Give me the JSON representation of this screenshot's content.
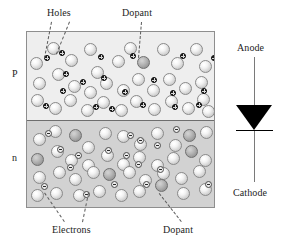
{
  "figure": {
    "title_labels": {
      "holes": "Holes",
      "dopant_top": "Dopant",
      "electrons": "Electrons",
      "dopant_bottom": "Dopant"
    },
    "region_labels": {
      "p": "P",
      "n": "n"
    },
    "diode": {
      "anode": "Anode",
      "cathode": "Cathode"
    },
    "colors": {
      "p_region_fill": "#eeeeee",
      "n_region_fill": "#d2d2d2",
      "block_border": "#8e8e8e",
      "junction_line": "#6e6e6e",
      "atom_light": "#f2f2f2",
      "atom_dopant": "#b6b6b6",
      "hole_fill": "#1c1c1c",
      "electron_fill": "#ececec",
      "diode_fill": "#000000",
      "leader_line": "#5c5c5c",
      "text": "#1d1d1d"
    }
  },
  "diagram_data": {
    "type": "schematic",
    "subject": "pn-junction semiconductor with dopants, holes and electrons, beside diode symbol",
    "block": {
      "x": 26,
      "y": 31,
      "width": 189,
      "height": 177
    },
    "p_region": {
      "x": 0,
      "y": 0,
      "width": 189,
      "height": 89
    },
    "n_region": {
      "x": 0,
      "y": 89,
      "width": 189,
      "height": 88
    },
    "p_atoms": [
      {
        "x": 3,
        "y": 25,
        "kind": "light"
      },
      {
        "x": 20,
        "y": 10,
        "kind": "light"
      },
      {
        "x": 38,
        "y": 22,
        "kind": "light"
      },
      {
        "x": 57,
        "y": 11,
        "kind": "light"
      },
      {
        "x": 64,
        "y": 34,
        "kind": "light"
      },
      {
        "x": 85,
        "y": 23,
        "kind": "light"
      },
      {
        "x": 97,
        "y": 10,
        "kind": "light"
      },
      {
        "x": 110,
        "y": 24,
        "kind": "dark"
      },
      {
        "x": 130,
        "y": 11,
        "kind": "light"
      },
      {
        "x": 144,
        "y": 25,
        "kind": "light"
      },
      {
        "x": 163,
        "y": 11,
        "kind": "light"
      },
      {
        "x": 172,
        "y": 28,
        "kind": "light"
      },
      {
        "x": 6,
        "y": 45,
        "kind": "light"
      },
      {
        "x": 25,
        "y": 36,
        "kind": "light"
      },
      {
        "x": 41,
        "y": 48,
        "kind": "light"
      },
      {
        "x": 57,
        "y": 54,
        "kind": "light"
      },
      {
        "x": 73,
        "y": 45,
        "kind": "light"
      },
      {
        "x": 90,
        "y": 52,
        "kind": "light"
      },
      {
        "x": 105,
        "y": 41,
        "kind": "light"
      },
      {
        "x": 120,
        "y": 52,
        "kind": "light"
      },
      {
        "x": 136,
        "y": 41,
        "kind": "light"
      },
      {
        "x": 152,
        "y": 50,
        "kind": "light"
      },
      {
        "x": 168,
        "y": 44,
        "kind": "light"
      },
      {
        "x": 4,
        "y": 62,
        "kind": "light"
      },
      {
        "x": 22,
        "y": 70,
        "kind": "light"
      },
      {
        "x": 37,
        "y": 62,
        "kind": "light"
      },
      {
        "x": 54,
        "y": 72,
        "kind": "light"
      },
      {
        "x": 70,
        "y": 64,
        "kind": "light"
      },
      {
        "x": 88,
        "y": 72,
        "kind": "light"
      },
      {
        "x": 103,
        "y": 63,
        "kind": "light"
      },
      {
        "x": 121,
        "y": 71,
        "kind": "light"
      },
      {
        "x": 138,
        "y": 63,
        "kind": "light"
      },
      {
        "x": 155,
        "y": 70,
        "kind": "light"
      },
      {
        "x": 170,
        "y": 61,
        "kind": "light"
      },
      {
        "x": 175,
        "y": 73,
        "kind": "light"
      }
    ],
    "p_holes": [
      {
        "x": 17,
        "y": 23
      },
      {
        "x": 32,
        "y": 18
      },
      {
        "x": 71,
        "y": 22
      },
      {
        "x": 103,
        "y": 21
      },
      {
        "x": 153,
        "y": 21
      },
      {
        "x": 184,
        "y": 23
      },
      {
        "x": 36,
        "y": 39
      },
      {
        "x": 53,
        "y": 47
      },
      {
        "x": 74,
        "y": 43
      },
      {
        "x": 124,
        "y": 45
      },
      {
        "x": 33,
        "y": 56
      },
      {
        "x": 95,
        "y": 57
      },
      {
        "x": 143,
        "y": 58
      },
      {
        "x": 174,
        "y": 56
      },
      {
        "x": 16,
        "y": 71
      },
      {
        "x": 66,
        "y": 72
      },
      {
        "x": 82,
        "y": 74
      },
      {
        "x": 113,
        "y": 70
      },
      {
        "x": 145,
        "y": 72
      },
      {
        "x": 169,
        "y": 70
      }
    ],
    "n_atoms": [
      {
        "x": 6,
        "y": 12,
        "kind": "light"
      },
      {
        "x": 22,
        "y": 4,
        "kind": "light"
      },
      {
        "x": 42,
        "y": 8,
        "kind": "dark"
      },
      {
        "x": 55,
        "y": 20,
        "kind": "light"
      },
      {
        "x": 72,
        "y": 6,
        "kind": "light"
      },
      {
        "x": 90,
        "y": 9,
        "kind": "light"
      },
      {
        "x": 107,
        "y": 17,
        "kind": "light"
      },
      {
        "x": 124,
        "y": 6,
        "kind": "light"
      },
      {
        "x": 142,
        "y": 18,
        "kind": "light"
      },
      {
        "x": 156,
        "y": 8,
        "kind": "dark"
      },
      {
        "x": 173,
        "y": 5,
        "kind": "light"
      },
      {
        "x": 4,
        "y": 32,
        "kind": "dark"
      },
      {
        "x": 24,
        "y": 24,
        "kind": "light"
      },
      {
        "x": 38,
        "y": 33,
        "kind": "light"
      },
      {
        "x": 55,
        "y": 38,
        "kind": "light"
      },
      {
        "x": 74,
        "y": 28,
        "kind": "light"
      },
      {
        "x": 90,
        "y": 37,
        "kind": "light"
      },
      {
        "x": 106,
        "y": 30,
        "kind": "light"
      },
      {
        "x": 124,
        "y": 38,
        "kind": "light"
      },
      {
        "x": 140,
        "y": 31,
        "kind": "light"
      },
      {
        "x": 158,
        "y": 24,
        "kind": "dark"
      },
      {
        "x": 172,
        "y": 33,
        "kind": "light"
      },
      {
        "x": 6,
        "y": 50,
        "kind": "light"
      },
      {
        "x": 26,
        "y": 45,
        "kind": "light"
      },
      {
        "x": 42,
        "y": 52,
        "kind": "light"
      },
      {
        "x": 60,
        "y": 45,
        "kind": "light"
      },
      {
        "x": 76,
        "y": 47,
        "kind": "dark"
      },
      {
        "x": 96,
        "y": 45,
        "kind": "light"
      },
      {
        "x": 112,
        "y": 53,
        "kind": "light"
      },
      {
        "x": 130,
        "y": 46,
        "kind": "light"
      },
      {
        "x": 148,
        "y": 51,
        "kind": "light"
      },
      {
        "x": 166,
        "y": 44,
        "kind": "light"
      },
      {
        "x": 4,
        "y": 68,
        "kind": "light"
      },
      {
        "x": 23,
        "y": 66,
        "kind": "light"
      },
      {
        "x": 46,
        "y": 68,
        "kind": "light"
      },
      {
        "x": 66,
        "y": 64,
        "kind": "light"
      },
      {
        "x": 88,
        "y": 68,
        "kind": "light"
      },
      {
        "x": 106,
        "y": 64,
        "kind": "light"
      },
      {
        "x": 128,
        "y": 58,
        "kind": "dark"
      },
      {
        "x": 150,
        "y": 66,
        "kind": "light"
      },
      {
        "x": 172,
        "y": 62,
        "kind": "light"
      }
    ],
    "n_electrons": [
      {
        "x": 18,
        "y": 9
      },
      {
        "x": 100,
        "y": 11
      },
      {
        "x": 146,
        "y": 5
      },
      {
        "x": 30,
        "y": 25
      },
      {
        "x": 110,
        "y": 16
      },
      {
        "x": 127,
        "y": 21
      },
      {
        "x": 48,
        "y": 31
      },
      {
        "x": 78,
        "y": 26
      },
      {
        "x": 96,
        "y": 31
      },
      {
        "x": 40,
        "y": 43
      },
      {
        "x": 108,
        "y": 40
      },
      {
        "x": 130,
        "y": 45
      },
      {
        "x": 14,
        "y": 62
      },
      {
        "x": 84,
        "y": 60
      },
      {
        "x": 56,
        "y": 70
      },
      {
        "x": 116,
        "y": 60
      },
      {
        "x": 178,
        "y": 60
      }
    ],
    "leaders": [
      {
        "name": "holes-leader-1",
        "x1": 52,
        "y1": 22,
        "x2": 45,
        "y2": 58
      },
      {
        "name": "holes-leader-2",
        "x1": 70,
        "y1": 22,
        "x2": 57,
        "y2": 54
      },
      {
        "name": "dopant-top-leader",
        "x1": 142,
        "y1": 22,
        "x2": 139,
        "y2": 58
      },
      {
        "name": "electrons-leader-1",
        "x1": 64,
        "y1": 222,
        "x2": 44,
        "y2": 193
      },
      {
        "name": "electrons-leader-2",
        "x1": 82,
        "y1": 222,
        "x2": 88,
        "y2": 193
      },
      {
        "name": "dopant-bottom-leader",
        "x1": 181,
        "y1": 222,
        "x2": 159,
        "y2": 194
      }
    ],
    "diode": {
      "wire_top": {
        "x": 254,
        "y1": 57,
        "y2": 106
      },
      "triangle": {
        "x_left": 236,
        "x_right": 273,
        "y_top": 105,
        "y_apex": 130
      },
      "bar": {
        "x1": 236,
        "x2": 273,
        "y": 130
      },
      "wire_bottom": {
        "x": 254,
        "y1": 131,
        "y2": 182
      }
    }
  }
}
